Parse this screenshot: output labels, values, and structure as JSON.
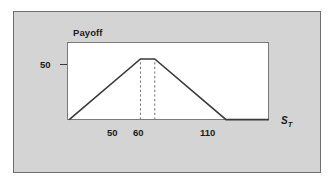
{
  "figure": {
    "panel_background": "#d4d4d4",
    "panel_border": "#6e6e6e",
    "plot_background": "#ffffff",
    "plot_border": "#7b7b7b"
  },
  "labels": {
    "payoff_title": "Payoff",
    "y_tick_50": "50",
    "x_tick_50": "50",
    "x_tick_60": "60",
    "x_tick_110": "110",
    "axis_st_base": "S",
    "axis_st_sub": "T"
  },
  "chart_data": {
    "type": "line",
    "title": "Payoff",
    "xlabel": "S_T",
    "ylabel": "Payoff",
    "xlim": [
      0,
      140
    ],
    "ylim": [
      0,
      62
    ],
    "grid": false,
    "legend": false,
    "line_color": "#3a3a3a",
    "line_width": 1.6,
    "series": [
      {
        "name": "Payoff",
        "x": [
          0,
          50,
          60,
          110,
          140
        ],
        "y": [
          0,
          50,
          50,
          0,
          0
        ]
      }
    ],
    "x_ticks": [
      50,
      60,
      110
    ],
    "x_tick_labels": [
      "50",
      "60",
      "110"
    ],
    "y_ticks": [
      50
    ],
    "y_tick_labels": [
      "50"
    ],
    "annotations": [
      {
        "type": "vertical-dashed-line",
        "x": 50,
        "y_from": 0,
        "y_to": 50,
        "color": "#7a7a7a"
      },
      {
        "type": "vertical-dashed-line",
        "x": 60,
        "y_from": 0,
        "y_to": 50,
        "color": "#7a7a7a"
      }
    ]
  }
}
